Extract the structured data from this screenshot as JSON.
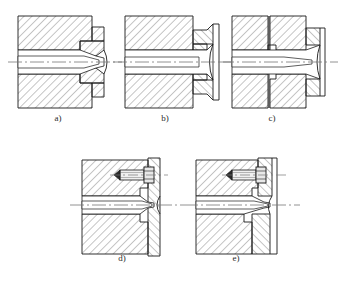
{
  "drawing": {
    "title": "Extrusion die / nozzle assembly cross-sections",
    "type": "engineering-cross-section-plate",
    "panel_count": 5,
    "line_color": "#1a1a1a",
    "hatch_color": "#555555",
    "centerline_color": "#707070",
    "background": "#ffffff",
    "hatch_angle_deg": 45,
    "hatch_spacing_px": 4
  },
  "figures": [
    {
      "id": "a",
      "caption": "a)",
      "description": "one-piece die body with integral tapered nozzle and stepped outer land",
      "row": 1,
      "column": 1,
      "x": 18,
      "y": 16,
      "w": 88,
      "h": 92,
      "has_insert": false,
      "has_bolt": false,
      "has_split_line": false,
      "bore": "tapered converging channel on horizontal axis"
    },
    {
      "id": "b",
      "caption": "b)",
      "description": "die body with separate counter-hatched insert ring and flared exit cone",
      "row": 1,
      "column": 2,
      "x": 125,
      "y": 16,
      "w": 88,
      "h": 92,
      "has_insert": true,
      "has_bolt": false,
      "has_split_line": false,
      "bore": "straight channel opening into a wide conical exit"
    },
    {
      "id": "c",
      "caption": "c)",
      "description": "split two-part die body with interlocking stepped joint and end insert",
      "row": 1,
      "column": 3,
      "x": 232,
      "y": 16,
      "w": 88,
      "h": 92,
      "has_insert": true,
      "has_bolt": false,
      "has_split_line": true,
      "bore": "tapered channel crossing the vertical parting plane"
    },
    {
      "id": "d",
      "caption": "d)",
      "description": "die body with bolted end plate, hex-head screw above the bore axis",
      "row": 2,
      "column": 1,
      "x": 82,
      "y": 160,
      "w": 88,
      "h": 92,
      "has_insert": true,
      "has_bolt": true,
      "has_split_line": false,
      "bore": "tapered converging channel with recessed shoulder"
    },
    {
      "id": "e",
      "caption": "e)",
      "description": "die body with bolted retainer ring and deeper conical nozzle seat",
      "row": 2,
      "column": 2,
      "x": 196,
      "y": 160,
      "w": 88,
      "h": 92,
      "has_insert": true,
      "has_bolt": true,
      "has_split_line": false,
      "bore": "tapered channel with stepped conical seat at exit"
    }
  ],
  "captions": {
    "a": "a)",
    "b": "b)",
    "c": "c)",
    "d": "d)",
    "e": "e)"
  }
}
